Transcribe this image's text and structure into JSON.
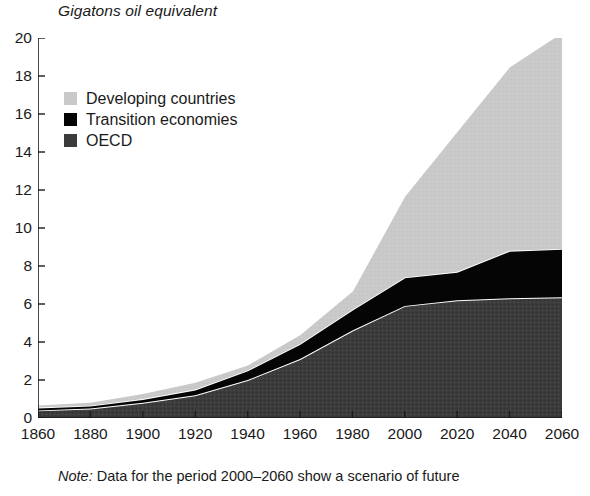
{
  "title": "Gigatons oil equivalent",
  "note": {
    "keyword": "Note:",
    "text": " Data for the period 2000–2060 show a scenario of future"
  },
  "colors": {
    "developing": "#c9c9c9",
    "transition": "#050505",
    "oecd": "#3b3b3b",
    "separator": "#ffffff",
    "axis": "#1a1a1a",
    "text": "#1a1a1a"
  },
  "legend": {
    "position": "inside-top-left",
    "items": [
      {
        "label": "Developing countries",
        "color": "#c9c9c9",
        "icon": "square-swatch-icon"
      },
      {
        "label": "Transition economies",
        "color": "#050505",
        "icon": "square-swatch-icon"
      },
      {
        "label": "OECD",
        "color": "#3b3b3b",
        "icon": "square-swatch-icon"
      }
    ]
  },
  "chart_data": {
    "type": "area",
    "stacked": true,
    "title": "Gigatons oil equivalent",
    "xlabel": "",
    "ylabel": "Gigatons oil equivalent",
    "xlim": [
      1860,
      2060
    ],
    "ylim": [
      0,
      20
    ],
    "ytick_step": 2,
    "xtick_step": 20,
    "grid": false,
    "ticks_inward": true,
    "x": [
      1860,
      1880,
      1900,
      1920,
      1940,
      1960,
      1980,
      2000,
      2020,
      2040,
      2060
    ],
    "xticklabels": [
      "1860",
      "1880",
      "1900",
      "1920",
      "1940",
      "1960",
      "1980",
      "2000",
      "2020",
      "2040",
      "2060"
    ],
    "yticklabels": [
      "0",
      "2",
      "4",
      "6",
      "8",
      "10",
      "12",
      "14",
      "16",
      "18",
      "20"
    ],
    "series": [
      {
        "name": "OECD",
        "color": "#3b3b3b",
        "values": [
          0.4,
          0.5,
          0.8,
          1.2,
          2.0,
          3.1,
          4.6,
          5.9,
          6.2,
          6.3,
          6.35
        ]
      },
      {
        "name": "Transition economies",
        "color": "#050505",
        "values": [
          0.15,
          0.15,
          0.2,
          0.3,
          0.5,
          0.8,
          1.1,
          1.5,
          1.5,
          2.5,
          2.55
        ]
      },
      {
        "name": "Developing countries",
        "color": "#c9c9c9",
        "values": [
          0.15,
          0.2,
          0.3,
          0.4,
          0.3,
          0.5,
          1.0,
          4.3,
          7.4,
          9.7,
          11.4
        ]
      }
    ],
    "cumulative_totals": [
      0.7,
      0.85,
      1.3,
      1.9,
      2.8,
      4.4,
      6.7,
      11.7,
      15.1,
      18.5,
      20.3
    ]
  }
}
